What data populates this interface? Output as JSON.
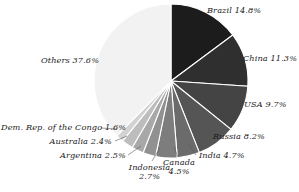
{
  "chart_data": {
    "type": "pie",
    "title": "",
    "subtitle": "",
    "xlabel": "",
    "ylabel": "",
    "legend": "none",
    "grid": false,
    "units": "percent",
    "start_angle_deg": 0,
    "direction": "clockwise",
    "categories": [
      "Brazil",
      "China",
      "USA",
      "Russia",
      "India",
      "Canada",
      "Indonesia",
      "Argentina",
      "Australia",
      "Dem. Rep. of the Congo",
      "Others"
    ],
    "values": [
      14.8,
      11.3,
      9.7,
      8.2,
      4.7,
      4.5,
      2.7,
      2.5,
      2.4,
      1.6,
      37.6
    ],
    "colors": [
      "#1c1c1c",
      "#2f2f2f",
      "#444444",
      "#555555",
      "#6b6b6b",
      "#7d7d7d",
      "#919191",
      "#a8a8a8",
      "#bdbdbd",
      "#d2d2d2",
      "#f2f2f2"
    ],
    "slices": [
      {
        "name": "Brazil",
        "value": 14.8,
        "label": "Brazil 14.8%",
        "color": "#1c1c1c"
      },
      {
        "name": "China",
        "value": 11.3,
        "label": "China 11.3%",
        "color": "#2f2f2f"
      },
      {
        "name": "USA",
        "value": 9.7,
        "label": "USA 9.7%",
        "color": "#444444"
      },
      {
        "name": "Russia",
        "value": 8.2,
        "label": "Russia 8.2%",
        "color": "#555555"
      },
      {
        "name": "India",
        "value": 4.7,
        "label": "India 4.7%",
        "color": "#6b6b6b"
      },
      {
        "name": "Canada",
        "value": 4.5,
        "label": "Canada",
        "label2": "4.5%",
        "color": "#7d7d7d"
      },
      {
        "name": "Indonesia",
        "value": 2.7,
        "label": "Indonesia",
        "label2": "2.7%",
        "color": "#919191"
      },
      {
        "name": "Argentina",
        "value": 2.5,
        "label": "Argentina 2.5%",
        "color": "#a8a8a8"
      },
      {
        "name": "Australia",
        "value": 2.4,
        "label": "Australia 2.4%",
        "color": "#bdbdbd"
      },
      {
        "name": "Dem. Rep. of the Congo",
        "value": 1.6,
        "label": "Dem. Rep. of the Congo 1.6%",
        "color": "#d2d2d2"
      },
      {
        "name": "Others",
        "value": 37.6,
        "label": "Others 37.6%",
        "color": "#f2f2f2"
      }
    ]
  },
  "labels": {
    "brazil": "Brazil 14.8%",
    "china": "China 11.3%",
    "usa": "USA 9.7%",
    "russia": "Russia 8.2%",
    "india": "India 4.7%",
    "canada_line1": "Canada",
    "canada_line2": "4.5%",
    "indonesia_line1": "Indonesia",
    "indonesia_line2": "2.7%",
    "argentina": "Argentina 2.5%",
    "australia": "Australia 2.4%",
    "congo": "Dem. Rep. of the Congo 1.6%",
    "others": "Others 37.6%"
  }
}
